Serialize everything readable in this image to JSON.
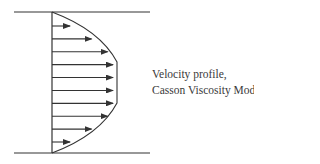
{
  "diagram": {
    "label_line1": "Velocity  profile,",
    "label_line2": "Casson Viscosity Model",
    "arrow_count": 10,
    "relative_velocities": [
      0.2,
      0.6,
      0.9,
      1.0,
      1.0,
      1.0,
      1.0,
      0.9,
      0.6,
      0.2
    ],
    "colors": {
      "line": "#333333",
      "text": "#3a3a3a",
      "background": "#ffffff"
    }
  }
}
